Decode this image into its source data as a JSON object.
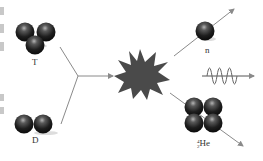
{
  "diagram": {
    "reactants": [
      {
        "id": "tritium",
        "label": "T",
        "particles": 3
      },
      {
        "id": "deuterium",
        "label": "D",
        "particles": 2
      }
    ],
    "products": [
      {
        "id": "neutron",
        "label": "n",
        "particles": 1
      },
      {
        "id": "energy",
        "label": "",
        "symbol": "wave"
      },
      {
        "id": "helium",
        "label": "He",
        "mass_number": "4",
        "atomic_number": "2",
        "particles": 4
      }
    ],
    "colors": {
      "particle": "#2a2a2a",
      "particle_highlight": "#9a9a9a",
      "arrow": "#8a8a8a",
      "burst": "#4a4a4a",
      "text": "#333333"
    }
  }
}
